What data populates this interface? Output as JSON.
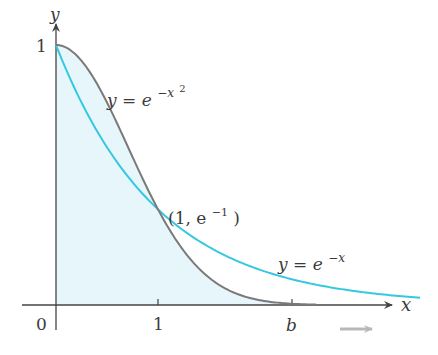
{
  "figure": {
    "axes": {
      "x_label": "x",
      "y_label": "y",
      "origin_label": "0",
      "x_ticks": [
        {
          "value": 1,
          "label": "1"
        },
        {
          "value": 2.3,
          "label": "b"
        }
      ],
      "y_ticks": [
        {
          "value": 1,
          "label": "1"
        }
      ]
    },
    "curves": [
      {
        "name": "gaussian",
        "label_base": "y = e",
        "label_exp": "−x",
        "label_exp2": "2",
        "color": "#7a7a7a"
      },
      {
        "name": "exponential",
        "label_base": "y = e",
        "label_exp": "−x",
        "color": "#35c8e0"
      }
    ],
    "intersection": {
      "label_open": "(1, e",
      "label_exp": "−1",
      "label_close": ")",
      "x": 1,
      "y": 0.3679
    },
    "shaded_region": {
      "from": 0,
      "to": 2.3,
      "under": "e^{-x^2}",
      "color": "#e6f6fb"
    },
    "colors": {
      "axis": "#444444",
      "gaussian": "#7a7a7a",
      "exponential": "#35c8e0",
      "shade": "#e6f6fb",
      "arrow_hint": "#b8b8b8"
    }
  },
  "chart_data": {
    "type": "line",
    "title": "",
    "xlabel": "x",
    "ylabel": "y",
    "xlim": [
      0,
      3.6
    ],
    "ylim": [
      0,
      1.05
    ],
    "grid": false,
    "series": [
      {
        "name": "y = e^{-x^2}",
        "x": [
          0,
          0.25,
          0.5,
          0.75,
          1,
          1.25,
          1.5,
          1.75,
          2,
          2.3,
          2.55
        ],
        "values": [
          1,
          0.939,
          0.779,
          0.57,
          0.368,
          0.21,
          0.105,
          0.047,
          0.018,
          0.005,
          0.0015
        ]
      },
      {
        "name": "y = e^{-x}",
        "x": [
          0,
          0.5,
          1,
          1.5,
          2,
          2.5,
          3,
          3.57
        ],
        "values": [
          1,
          0.607,
          0.368,
          0.223,
          0.135,
          0.082,
          0.05,
          0.028
        ]
      }
    ],
    "annotations": [
      {
        "text": "(1, e^{-1})",
        "x": 1,
        "y": 0.368
      },
      {
        "text": "b",
        "x": 2.3,
        "y": 0
      },
      {
        "text": "1",
        "axis": "x",
        "value": 1
      },
      {
        "text": "1",
        "axis": "y",
        "value": 1
      },
      {
        "text": "0",
        "x": 0,
        "y": 0
      }
    ],
    "shaded": {
      "under": "y = e^{-x^2}",
      "x_from": 0,
      "x_to": 2.3
    }
  }
}
